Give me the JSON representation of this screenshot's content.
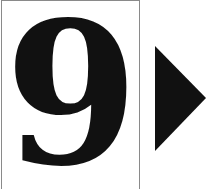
{
  "card": {
    "digit": "9"
  },
  "next_button": {
    "icon": "play-triangle-icon",
    "color": "#111111"
  }
}
